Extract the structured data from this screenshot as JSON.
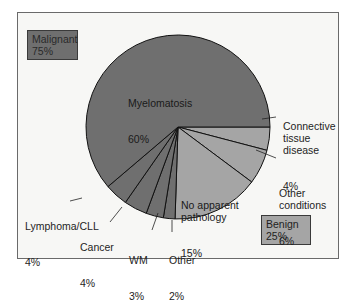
{
  "chart_data": {
    "type": "pie",
    "title": "",
    "start_angle_deg": 0,
    "direction": "clockwise",
    "slices": [
      {
        "label": "Connective tissue disease",
        "value": 4,
        "group": "Benign"
      },
      {
        "label": "Other conditions",
        "value": 6,
        "group": "Benign"
      },
      {
        "label": "No apparent pathology",
        "value": 15,
        "group": "Benign"
      },
      {
        "label": "Other",
        "value": 2,
        "group": "Malignant"
      },
      {
        "label": "WM",
        "value": 3,
        "group": "Malignant"
      },
      {
        "label": "Cancer",
        "value": 4,
        "group": "Malignant"
      },
      {
        "label": "Lymphoma/CLL",
        "value": 4,
        "group": "Malignant"
      },
      {
        "label": "Myelomatosis",
        "value": 60,
        "group": "Malignant"
      }
    ],
    "groups": [
      {
        "name": "Malignant",
        "value": 75,
        "color": "#6f6f6f"
      },
      {
        "name": "Benign",
        "value": 25,
        "color": "#a5a5a5"
      }
    ]
  },
  "legend": {
    "malignant": {
      "name": "Malignant",
      "pct": "75%"
    },
    "benign": {
      "name": "Benign",
      "pct": "25%"
    }
  },
  "labels": {
    "myelomatosis": {
      "text": "Myelomatosis",
      "pct": "60%"
    },
    "connective": {
      "text": "Connective\ntissue\ndisease",
      "pct": "4%"
    },
    "other_conditions": {
      "text": "Other\nconditions",
      "pct": "6%"
    },
    "no_pathology": {
      "text": "No apparent\npathology",
      "pct": "15%"
    },
    "lymphoma": {
      "text": "Lymphoma/CLL",
      "pct": "4%"
    },
    "cancer": {
      "text": "Cancer",
      "pct": "4%"
    },
    "wm": {
      "text": "WM",
      "pct": "3%"
    },
    "other": {
      "text": "Other",
      "pct": "2%"
    }
  },
  "colors": {
    "malignant": "#6f6f6f",
    "benign": "#a5a5a5",
    "line": "#111111"
  }
}
